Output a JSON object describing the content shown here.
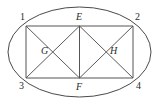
{
  "figure": {
    "canvas": {
      "width": 160,
      "height": 104
    },
    "style": {
      "stroke_color": "#4a4a4a",
      "ellipse_stroke": "#4a4a4a",
      "rect_stroke": "#555555",
      "diagonal_stroke": "#5a5a5a",
      "background": "#ffffff",
      "label_color": "#2a2a2a",
      "stroke_width": 1
    },
    "ellipse": {
      "name": "outer-ellipse",
      "cx": 79.5,
      "cy": 52,
      "rx": 71.5,
      "ry": 45
    },
    "rectangle": {
      "name": "inscribed-rectangle",
      "left": 26,
      "right": 133,
      "top": 26,
      "bottom": 78
    },
    "points": [
      {
        "id": "p1",
        "label": "1",
        "x": 26,
        "y": 26,
        "label_x": 20,
        "label_y": 12,
        "italic": false
      },
      {
        "id": "p2",
        "label": "2",
        "x": 133,
        "y": 26,
        "label_x": 135,
        "label_y": 12,
        "italic": false
      },
      {
        "id": "p3",
        "label": "3",
        "x": 26,
        "y": 78,
        "label_x": 19,
        "label_y": 81,
        "italic": false
      },
      {
        "id": "p4",
        "label": "4",
        "x": 133,
        "y": 78,
        "label_x": 136,
        "label_y": 81,
        "italic": false
      },
      {
        "id": "pE",
        "label": "E",
        "x": 79.5,
        "y": 26,
        "label_x": 76,
        "label_y": 12,
        "italic": true
      },
      {
        "id": "pF",
        "label": "F",
        "x": 79.5,
        "y": 78,
        "label_x": 76,
        "label_y": 82,
        "italic": true
      },
      {
        "id": "pG",
        "label": "G",
        "x": 52.75,
        "y": 52,
        "label_x": 41,
        "label_y": 46,
        "italic": true
      },
      {
        "id": "pH",
        "label": "H",
        "x": 106.2,
        "y": 52,
        "label_x": 110,
        "label_y": 46,
        "italic": true
      }
    ],
    "segments": [
      {
        "name": "edge-1-2",
        "x1": 26,
        "y1": 26,
        "x2": 133,
        "y2": 26
      },
      {
        "name": "edge-3-4",
        "x1": 26,
        "y1": 78,
        "x2": 133,
        "y2": 78
      },
      {
        "name": "edge-1-3",
        "x1": 26,
        "y1": 26,
        "x2": 26,
        "y2": 78
      },
      {
        "name": "edge-2-4",
        "x1": 133,
        "y1": 26,
        "x2": 133,
        "y2": 78
      },
      {
        "name": "segment-E-F",
        "x1": 79.5,
        "y1": 26,
        "x2": 79.5,
        "y2": 78
      },
      {
        "name": "segment-1-F",
        "x1": 26,
        "y1": 26,
        "x2": 79.5,
        "y2": 78
      },
      {
        "name": "segment-3-E",
        "x1": 26,
        "y1": 78,
        "x2": 79.5,
        "y2": 26
      },
      {
        "name": "segment-E-4",
        "x1": 79.5,
        "y1": 26,
        "x2": 133,
        "y2": 78
      },
      {
        "name": "segment-F-2",
        "x1": 79.5,
        "y1": 78,
        "x2": 133,
        "y2": 26
      }
    ]
  }
}
